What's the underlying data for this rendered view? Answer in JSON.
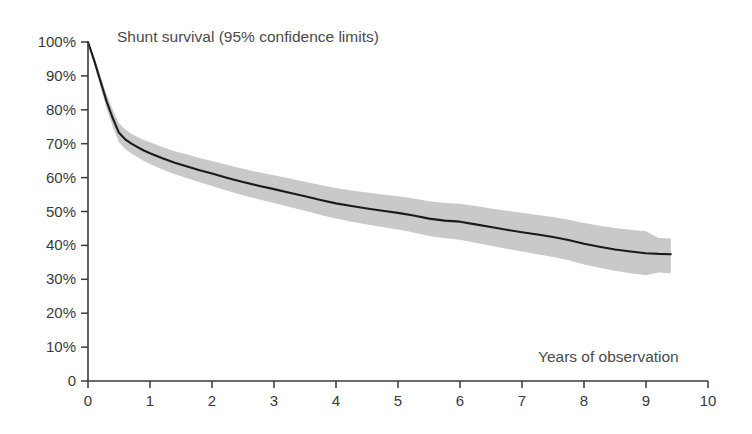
{
  "chart_data": {
    "type": "line",
    "title": "Shunt survival (95% confidence limits)",
    "xlabel": "Years of observation",
    "ylabel": "",
    "xlim": [
      0,
      10
    ],
    "ylim": [
      0,
      100
    ],
    "grid": false,
    "legend_position": "none",
    "x_ticks": [
      "0",
      "1",
      "2",
      "3",
      "4",
      "5",
      "6",
      "7",
      "8",
      "9",
      "10"
    ],
    "x_tick_values": [
      0,
      1,
      2,
      3,
      4,
      5,
      6,
      7,
      8,
      9,
      10
    ],
    "y_ticks": [
      "0",
      "10%",
      "20%",
      "30%",
      "40%",
      "50%",
      "60%",
      "70%",
      "80%",
      "90%",
      "100%"
    ],
    "y_tick_values": [
      0,
      10,
      20,
      30,
      40,
      50,
      60,
      70,
      80,
      90,
      100
    ],
    "x": [
      0.0,
      0.1,
      0.2,
      0.3,
      0.4,
      0.5,
      0.6,
      0.7,
      0.8,
      0.9,
      1.0,
      1.2,
      1.4,
      1.6,
      1.8,
      2.0,
      2.25,
      2.5,
      2.75,
      3.0,
      3.25,
      3.5,
      3.75,
      4.0,
      4.25,
      4.5,
      4.75,
      5.0,
      5.25,
      5.5,
      5.75,
      6.0,
      6.25,
      6.5,
      6.75,
      7.0,
      7.25,
      7.5,
      7.75,
      8.0,
      8.25,
      8.5,
      8.75,
      9.0,
      9.2,
      9.4
    ],
    "series": [
      {
        "name": "Shunt survival",
        "style": "line",
        "color": "#1a1a1a",
        "values": [
          100.0,
          94.5,
          88.5,
          82.5,
          77.5,
          73.2,
          71.3,
          70.0,
          69.0,
          68.0,
          67.2,
          65.7,
          64.4,
          63.3,
          62.2,
          61.2,
          59.9,
          58.7,
          57.6,
          56.6,
          55.5,
          54.5,
          53.4,
          52.4,
          51.6,
          50.9,
          50.2,
          49.6,
          48.8,
          47.9,
          47.3,
          47.0,
          46.2,
          45.4,
          44.6,
          43.9,
          43.2,
          42.5,
          41.6,
          40.5,
          39.6,
          38.8,
          38.2,
          37.7,
          37.5,
          37.4
        ]
      },
      {
        "name": "Upper 95% confidence limit",
        "style": "band-upper",
        "color": "#c8c8c8",
        "values": [
          100.0,
          95.6,
          90.2,
          84.6,
          80.0,
          76.0,
          74.2,
          72.9,
          72.0,
          71.1,
          70.4,
          69.0,
          67.8,
          66.8,
          65.8,
          64.9,
          63.7,
          62.6,
          61.6,
          60.7,
          59.7,
          58.8,
          57.8,
          56.9,
          56.2,
          55.6,
          55.0,
          54.5,
          53.8,
          53.0,
          52.5,
          52.3,
          51.6,
          50.9,
          50.2,
          49.6,
          49.0,
          48.4,
          47.6,
          46.6,
          45.8,
          45.1,
          44.6,
          44.2,
          42.2,
          42.0
        ]
      },
      {
        "name": "Lower 95% confidence limit",
        "style": "band-lower",
        "color": "#c8c8c8",
        "values": [
          100.0,
          93.4,
          86.8,
          80.4,
          75.0,
          70.4,
          68.4,
          67.1,
          66.0,
          64.9,
          64.0,
          62.4,
          61.0,
          59.8,
          58.6,
          57.5,
          56.1,
          54.8,
          53.6,
          52.5,
          51.3,
          50.2,
          49.0,
          47.9,
          47.0,
          46.2,
          45.4,
          44.7,
          43.8,
          42.8,
          42.1,
          41.7,
          40.8,
          39.9,
          39.0,
          38.2,
          37.4,
          36.6,
          35.6,
          34.4,
          33.4,
          32.5,
          31.8,
          31.2,
          32.0,
          31.8
        ]
      }
    ],
    "annotations": [
      {
        "text": "Shunt survival (95% confidence limits)",
        "x_px": 117,
        "y_px": 28,
        "role": "chart-title"
      },
      {
        "text": "Years of observation",
        "x_px": 538,
        "y_px": 348,
        "role": "x-axis-label"
      }
    ]
  },
  "axes": {
    "origin_px": {
      "x": 88,
      "y": 381
    },
    "x_end_px": 708,
    "y_top_px": 42,
    "axis_color": "#3a3a3a"
  }
}
